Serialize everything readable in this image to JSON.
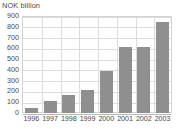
{
  "chart_data": {
    "type": "bar",
    "title": "NOK billion",
    "xlabel": "",
    "ylabel": "",
    "categories": [
      "1996",
      "1997",
      "1998",
      "1999",
      "2000",
      "2001",
      "2002",
      "2003"
    ],
    "values": [
      50,
      110,
      165,
      218,
      388,
      615,
      612,
      848
    ],
    "series": [
      {
        "name": "NOK billion",
        "values": [
          50,
          110,
          165,
          218,
          388,
          615,
          612,
          848
        ]
      }
    ],
    "ylim": [
      0,
      900
    ],
    "ytick_values": [
      0,
      100,
      200,
      300,
      400,
      500,
      600,
      700,
      800,
      900
    ],
    "ytick_labels": [
      "0",
      "100",
      "200",
      "300",
      "400",
      "500",
      "600",
      "700",
      "800",
      "900"
    ],
    "grid": true,
    "grid_orientation": "both",
    "legend": false,
    "legend_position": "none",
    "bar_color": "#8f8f8f",
    "grid_color": "#dcdcdc",
    "axis_color": "#b8b8b8",
    "text_color": "#4a4a4a",
    "background_color": "#ffffff"
  }
}
